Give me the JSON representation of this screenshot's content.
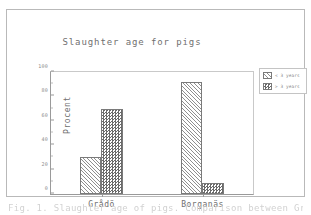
{
  "chart_data": {
    "type": "bar",
    "title": "Slaughter age for pigs",
    "xlabel": "",
    "ylabel": "Procent",
    "categories": [
      "Grådö",
      "Borganäs"
    ],
    "series": [
      {
        "name": "< 3 years",
        "values": [
          30,
          92
        ],
        "pattern": "diagonal-hatch"
      },
      {
        "name": "> 3 years",
        "values": [
          70,
          9
        ],
        "pattern": "checkerboard"
      }
    ],
    "ylim": [
      0,
      100
    ],
    "yticks": [
      0,
      20,
      40,
      60,
      80,
      100
    ],
    "ytick_labels": [
      "0",
      "20",
      "40",
      "60",
      "80",
      "100"
    ],
    "grid": false,
    "legend_position": "right"
  },
  "legend": {
    "entries": [
      {
        "label": "< 3 years"
      },
      {
        "label": "> 3 years"
      }
    ]
  },
  "caption": {
    "text": "Fig. 1. Slaughter age of pigs. Comparison between Grådö and Borganäs."
  },
  "colors": {
    "axis": "#9a9a9a",
    "text": "#6f6f6f",
    "frame": "#b9b9b9",
    "background": "#ffffff",
    "bar_outline": "#7a7a7a"
  }
}
